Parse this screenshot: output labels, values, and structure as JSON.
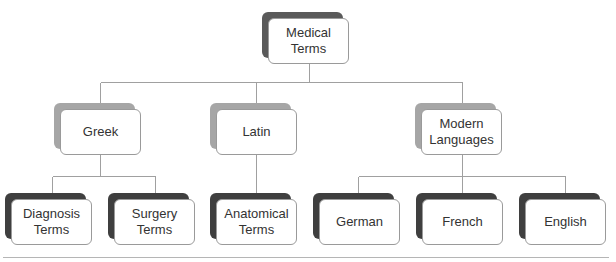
{
  "diagram": {
    "type": "hierarchy-tree",
    "root": {
      "id": "medical-terms",
      "label": "Medical\nTerms"
    },
    "categories": [
      {
        "id": "greek",
        "label": "Greek",
        "children": [
          {
            "id": "diagnosis-terms",
            "label": "Diagnosis\nTerms"
          },
          {
            "id": "surgery-terms",
            "label": "Surgery\nTerms"
          }
        ]
      },
      {
        "id": "latin",
        "label": "Latin",
        "children": [
          {
            "id": "anatomical-terms",
            "label": "Anatomical\nTerms"
          }
        ]
      },
      {
        "id": "modern-languages",
        "label": "Modern\nLanguages",
        "children": [
          {
            "id": "german",
            "label": "German"
          },
          {
            "id": "french",
            "label": "French"
          },
          {
            "id": "english",
            "label": "English"
          }
        ]
      }
    ],
    "colors": {
      "connector": "#a0a0a0",
      "box_border": "#9a9a9a",
      "root_shadow": "#5a5a5a",
      "mid_shadow": "#a6a6a6",
      "leaf_shadow": "#3f3f3f",
      "text": "#333333"
    }
  }
}
